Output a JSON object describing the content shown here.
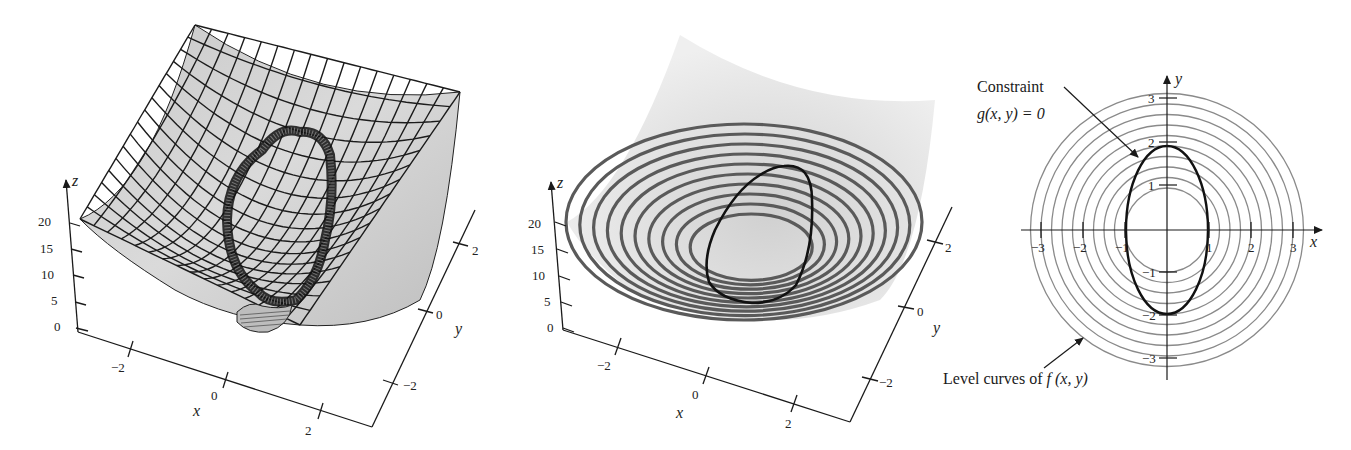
{
  "figure": {
    "panels": [
      {
        "id": "surface-with-constraint-cylinder",
        "axes": {
          "z_label": "z",
          "x_label": "x",
          "y_label": "y",
          "z_ticks": [
            "0",
            "5",
            "10",
            "15",
            "20"
          ],
          "x_ticks": [
            "−2",
            "0",
            "2"
          ],
          "y_ticks": [
            "−2",
            "0",
            "2"
          ]
        }
      },
      {
        "id": "surface-with-level-curves",
        "axes": {
          "z_label": "z",
          "x_label": "x",
          "y_label": "y",
          "z_ticks": [
            "0",
            "5",
            "10",
            "15",
            "20"
          ],
          "x_ticks": [
            "−2",
            "0",
            "2"
          ],
          "y_ticks": [
            "−2",
            "0",
            "2"
          ]
        }
      },
      {
        "id": "contour-plot",
        "axes": {
          "x_label": "x",
          "y_label": "y",
          "x_ticks": [
            "−3",
            "−2",
            "−1",
            "1",
            "2",
            "3"
          ],
          "y_ticks": [
            "3",
            "2",
            "1",
            "−1",
            "−2",
            "−3"
          ]
        },
        "annotations": {
          "constraint_line1": "Constraint",
          "constraint_line2": "g(x, y) = 0",
          "level_curves_prefix": "Level curves of ",
          "level_curves_func": "f (x, y)"
        }
      }
    ]
  },
  "chart_data": [
    {
      "type": "surface3d",
      "title": "",
      "function": "paraboloid z = f(x, y) cut by constraint cylinder g(x, y) = 0",
      "xlabel": "x",
      "ylabel": "y",
      "zlabel": "z",
      "xlim": [
        -3,
        3
      ],
      "ylim": [
        -3,
        3
      ],
      "zlim": [
        0,
        20
      ],
      "x_ticks": [
        -2,
        0,
        2
      ],
      "y_ticks": [
        -2,
        0,
        2
      ],
      "z_ticks": [
        0,
        5,
        10,
        15,
        20
      ],
      "grid": "wireframe mesh on surface"
    },
    {
      "type": "surface3d",
      "title": "",
      "function": "paraboloid z = f(x, y) with level curves drawn and constraint curve",
      "xlabel": "x",
      "ylabel": "y",
      "zlabel": "z",
      "xlim": [
        -3,
        3
      ],
      "ylim": [
        -3,
        3
      ],
      "zlim": [
        0,
        20
      ],
      "x_ticks": [
        -2,
        0,
        2
      ],
      "y_ticks": [
        -2,
        0,
        2
      ],
      "z_ticks": [
        0,
        5,
        10,
        15,
        20
      ],
      "level_curve_count": 10
    },
    {
      "type": "contour",
      "title": "",
      "xlabel": "x",
      "ylabel": "y",
      "xlim": [
        -3.5,
        3.5
      ],
      "ylim": [
        -3.5,
        3.5
      ],
      "x_ticks": [
        -3,
        -2,
        -1,
        1,
        2,
        3
      ],
      "y_ticks": [
        -3,
        -2,
        -1,
        1,
        2,
        3
      ],
      "level_curves": {
        "shape": "concentric circles centered at origin",
        "radii": [
          1.0,
          1.25,
          1.5,
          1.75,
          2.0,
          2.25,
          2.5,
          2.75,
          3.0,
          3.25
        ]
      },
      "constraint_curve": {
        "shape": "ellipse centered at origin",
        "semi_axis_x": 1.0,
        "semi_axis_y": 2.0
      },
      "annotations": [
        "Constraint g(x, y) = 0",
        "Level curves of f (x, y)"
      ]
    }
  ],
  "colors": {
    "surface_fill": "#d4d4d4",
    "surface_fill_light": "#e6e6e6",
    "mesh_line": "#1c1c1c",
    "level_curve_3d": "#5a5a5a",
    "level_curve_2d": "#8a8a8a",
    "constraint": "#111111",
    "axis": "#1a1a1a"
  }
}
